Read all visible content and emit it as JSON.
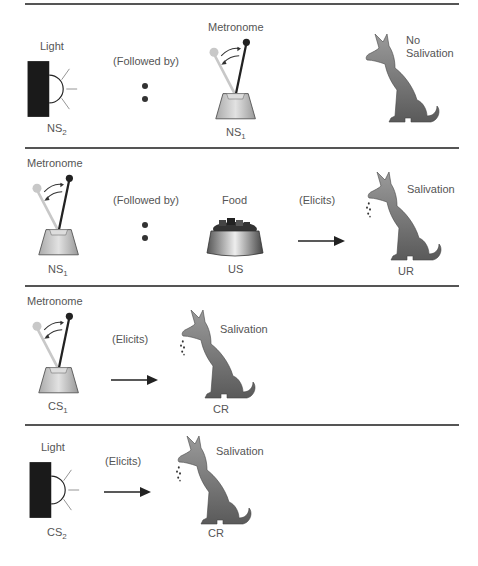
{
  "figure": {
    "panels": [
      {
        "id": "panel-1",
        "left_label": "Light",
        "left_stim": "NS",
        "left_sub": "2",
        "relation": "(Followed by)",
        "mid_label": "Metronome",
        "mid_stim": "NS",
        "mid_sub": "1",
        "response": "No\nSalivation",
        "response_line1": "No",
        "response_line2": "Salivation"
      },
      {
        "id": "panel-2",
        "left_label": "Metronome",
        "left_stim": "NS",
        "left_sub": "1",
        "relation": "(Followed by)",
        "mid_label": "Food",
        "mid_stim": "US",
        "relation2": "(Elicits)",
        "response": "Salivation",
        "response_stim": "UR"
      },
      {
        "id": "panel-3",
        "left_label": "Metronome",
        "left_stim": "CS",
        "left_sub": "1",
        "relation": "(Elicits)",
        "response": "Salivation",
        "response_stim": "CR"
      },
      {
        "id": "panel-4",
        "left_label": "Light",
        "left_stim": "CS",
        "left_sub": "2",
        "relation": "(Elicits)",
        "response": "Salivation",
        "response_stim": "CR"
      }
    ],
    "colors": {
      "rule": "#555555",
      "text": "#555555",
      "dog": "#7a7a7a",
      "light_box": "#1a1a1a"
    }
  }
}
